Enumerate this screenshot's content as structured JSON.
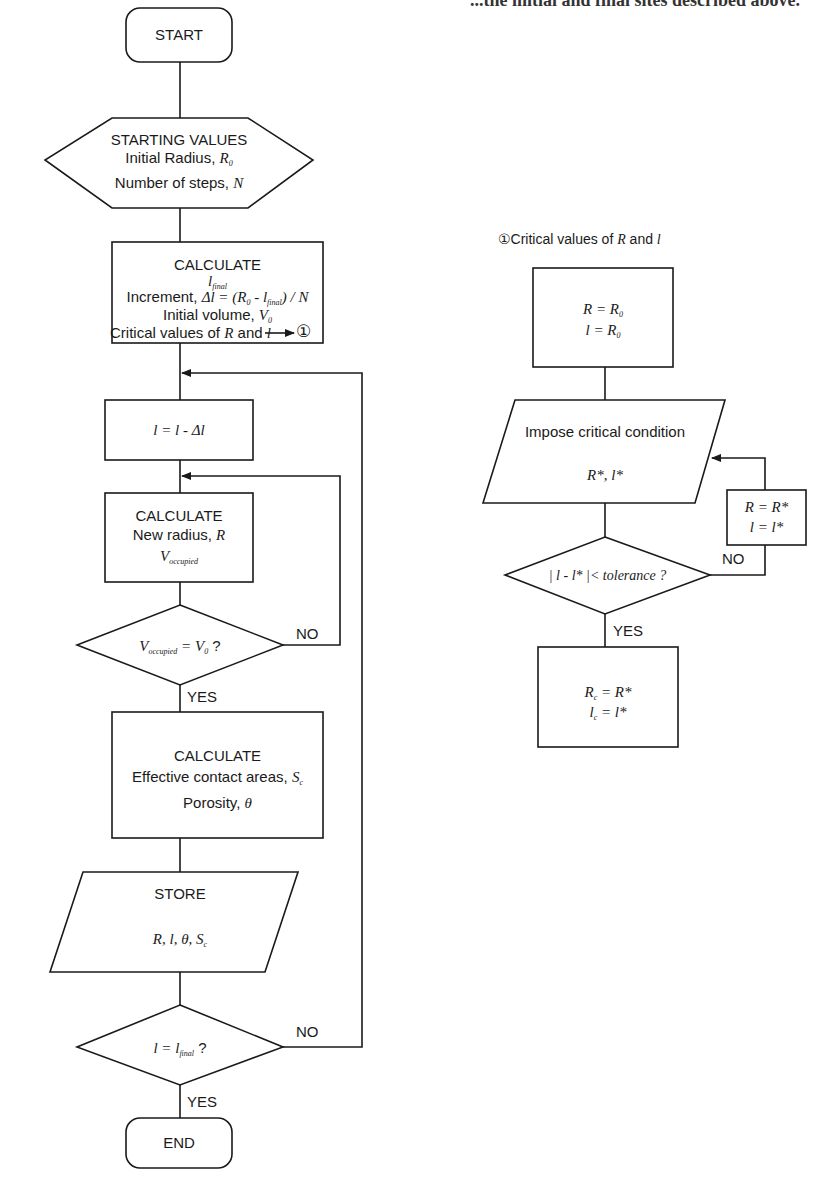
{
  "top_caption": "...the initial and final sites described above.",
  "main_flow": {
    "start": "START",
    "starting_values": {
      "title": "STARTING VALUES",
      "line1": "Initial Radius, ",
      "line1_var": "R",
      "line1_sub": "0",
      "line2": "Number of steps, ",
      "line2_var": "N"
    },
    "calculate1": {
      "title": "CALCULATE",
      "line1_var": "l",
      "line1_sub": "final",
      "line2_prefix": "Increment, ",
      "line2_expr": "Δl = (R",
      "line2_sub1": "0",
      "line2_mid": " - l",
      "line2_sub2": "final",
      "line2_end": ") / N",
      "line3": "Initial volume, ",
      "line3_var": "V",
      "line3_sub": "0",
      "line4": "Critical values of ",
      "line4_var1": "R",
      "line4_and": " and ",
      "line4_var2": "l",
      "line4_ref": "①"
    },
    "decrement": "l = l - Δl",
    "calculate2": {
      "title": "CALCULATE",
      "line1": "New radius, ",
      "line1_var": "R",
      "line2_var": "V",
      "line2_sub": "occupied"
    },
    "decision1": {
      "var": "V",
      "sub": "occupied",
      "rest": " = V",
      "sub2": "0",
      "q": " ?",
      "no": "NO",
      "yes": "YES"
    },
    "calculate3": {
      "title": "CALCULATE",
      "line1": "Effective contact areas, ",
      "line1_var": "S",
      "line1_sub": "c",
      "line2": "Porosity, ",
      "line2_var": "θ"
    },
    "store": {
      "title": "STORE",
      "vars": "R, l, θ, S",
      "vars_sub": "c"
    },
    "decision2": {
      "expr": "l = l",
      "sub": "final",
      "q": " ?",
      "no": "NO",
      "yes": "YES"
    },
    "end": "END"
  },
  "sub_flow": {
    "title_ref": "①",
    "title_text": "Critical values of ",
    "title_var1": "R",
    "title_and": " and ",
    "title_var2": "l",
    "init_box": {
      "line1": "R = R",
      "line1_sub": "0",
      "line2": "l = R",
      "line2_sub": "0"
    },
    "impose": {
      "title": "Impose critical condition",
      "vars": "R*, l*"
    },
    "decision": {
      "expr": "| l - l* |< tolerance ?",
      "no": "NO",
      "yes": "YES"
    },
    "update_box": {
      "line1": "R = R*",
      "line2": "l = l*"
    },
    "result_box": {
      "line1": "R",
      "line1_sub": "c",
      "line1_rest": " = R*",
      "line2": "l",
      "line2_sub": "c",
      "line2_rest": " = l*"
    }
  },
  "colors": {
    "stroke": "#1a1a1a",
    "background": "#ffffff"
  }
}
